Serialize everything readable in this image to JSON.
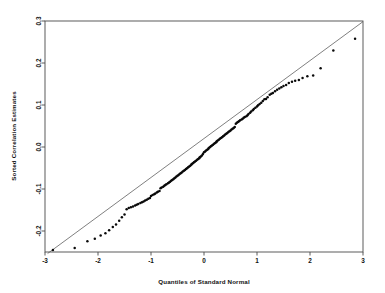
{
  "chart_data": {
    "type": "scatter",
    "title": "",
    "xlabel": "Quantiles of Standard Normal",
    "ylabel": "Sorted Correlation Estimates",
    "xlim": [
      -3,
      3
    ],
    "ylim": [
      -0.25,
      0.3
    ],
    "xticks": [
      -3,
      -2,
      -1,
      0,
      1,
      2,
      3
    ],
    "xticklabels": [
      "-3",
      "-2",
      "-1",
      "0",
      "1",
      "2",
      "3"
    ],
    "yticks": [
      -0.2,
      -0.1,
      0.0,
      0.1,
      0.2,
      0.3
    ],
    "yticklabels": [
      "-0.2",
      "-0.1",
      "0.0",
      "0.1",
      "0.2",
      "0.3"
    ],
    "grid": false,
    "legend": null,
    "reference_line": {
      "name": "qq-reference-line",
      "x": [
        -2.95,
        3.0
      ],
      "y": [
        -0.2535,
        0.2985
      ],
      "style": "solid",
      "color": "#555555"
    },
    "series": [
      {
        "name": "Sorted Correlation Estimates",
        "marker": "filled-circle",
        "color": "#0a0a0a",
        "x": [
          -2.85,
          -2.44,
          -2.2,
          -2.06,
          -1.95,
          -1.86,
          -1.79,
          -1.72,
          -1.66,
          -1.6,
          -1.55,
          -1.5,
          -1.46,
          -1.42,
          -1.38,
          -1.34,
          -1.3,
          -1.27,
          -1.24,
          -1.2,
          -1.17,
          -1.14,
          -1.11,
          -1.08,
          -1.05,
          -1.02,
          -1.0,
          -0.97,
          -0.94,
          -0.92,
          -0.89,
          -0.87,
          -0.84,
          -0.82,
          -0.8,
          -0.77,
          -0.75,
          -0.73,
          -0.71,
          -0.68,
          -0.66,
          -0.64,
          -0.62,
          -0.6,
          -0.58,
          -0.56,
          -0.54,
          -0.52,
          -0.5,
          -0.48,
          -0.46,
          -0.44,
          -0.42,
          -0.4,
          -0.38,
          -0.36,
          -0.34,
          -0.32,
          -0.3,
          -0.28,
          -0.26,
          -0.24,
          -0.23,
          -0.21,
          -0.19,
          -0.17,
          -0.15,
          -0.13,
          -0.11,
          -0.09,
          -0.08,
          -0.06,
          -0.04,
          -0.02,
          0.0,
          0.02,
          0.04,
          0.06,
          0.08,
          0.09,
          0.11,
          0.13,
          0.15,
          0.17,
          0.19,
          0.21,
          0.23,
          0.24,
          0.26,
          0.28,
          0.3,
          0.32,
          0.34,
          0.36,
          0.38,
          0.4,
          0.42,
          0.44,
          0.46,
          0.48,
          0.5,
          0.52,
          0.54,
          0.56,
          0.58,
          0.6,
          0.62,
          0.64,
          0.66,
          0.68,
          0.71,
          0.73,
          0.75,
          0.77,
          0.8,
          0.82,
          0.84,
          0.87,
          0.89,
          0.92,
          0.94,
          0.97,
          1.0,
          1.02,
          1.05,
          1.08,
          1.11,
          1.14,
          1.17,
          1.2,
          1.24,
          1.27,
          1.3,
          1.34,
          1.38,
          1.42,
          1.46,
          1.5,
          1.55,
          1.6,
          1.66,
          1.72,
          1.79,
          1.86,
          1.95,
          2.06,
          2.2,
          2.44,
          2.85
        ],
        "y": [
          -0.2455,
          -0.2405,
          -0.2245,
          -0.2185,
          -0.2105,
          -0.2055,
          -0.1985,
          -0.1905,
          -0.1845,
          -0.1755,
          -0.1675,
          -0.1605,
          -0.1485,
          -0.1455,
          -0.1435,
          -0.1415,
          -0.1395,
          -0.1375,
          -0.1355,
          -0.1335,
          -0.1315,
          -0.1295,
          -0.1275,
          -0.1255,
          -0.1235,
          -0.1215,
          -0.1165,
          -0.1145,
          -0.1125,
          -0.1105,
          -0.1085,
          -0.1065,
          -0.1045,
          -0.0985,
          -0.0965,
          -0.0945,
          -0.0925,
          -0.0905,
          -0.0885,
          -0.0865,
          -0.0845,
          -0.0825,
          -0.0805,
          -0.0785,
          -0.0765,
          -0.0745,
          -0.0725,
          -0.0705,
          -0.0685,
          -0.0665,
          -0.0645,
          -0.0625,
          -0.0605,
          -0.0585,
          -0.0565,
          -0.0545,
          -0.0525,
          -0.0505,
          -0.0485,
          -0.0465,
          -0.0445,
          -0.0425,
          -0.0405,
          -0.0385,
          -0.0365,
          -0.0345,
          -0.0325,
          -0.0305,
          -0.0285,
          -0.0265,
          -0.0245,
          -0.0225,
          -0.0205,
          -0.0165,
          -0.0125,
          -0.0105,
          -0.0085,
          -0.0065,
          -0.0045,
          -0.0025,
          -0.0005,
          0.0015,
          0.0035,
          0.0055,
          0.0075,
          0.0095,
          0.0115,
          0.0135,
          0.0155,
          0.0175,
          0.0195,
          0.0215,
          0.0235,
          0.0255,
          0.0275,
          0.0295,
          0.0315,
          0.0335,
          0.0355,
          0.0375,
          0.0395,
          0.0415,
          0.0435,
          0.0455,
          0.0475,
          0.0555,
          0.0575,
          0.0595,
          0.0615,
          0.0635,
          0.0655,
          0.0675,
          0.0695,
          0.0715,
          0.0735,
          0.0755,
          0.0785,
          0.0815,
          0.0845,
          0.0875,
          0.0905,
          0.0935,
          0.0965,
          0.0995,
          0.1025,
          0.1055,
          0.1095,
          0.1135,
          0.1145,
          0.1185,
          0.1245,
          0.1265,
          0.1285,
          0.1325,
          0.1365,
          0.1395,
          0.1425,
          0.1455,
          0.1475,
          0.1525,
          0.1555,
          0.1575,
          0.1595,
          0.1645,
          0.1685,
          0.1705,
          0.1875,
          0.2295,
          0.2575
        ]
      }
    ]
  }
}
